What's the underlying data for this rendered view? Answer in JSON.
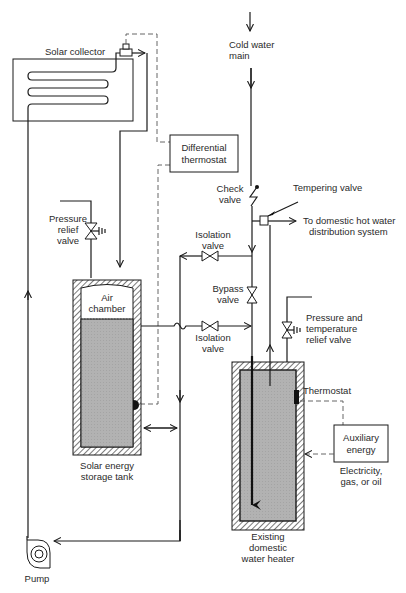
{
  "diagram": {
    "type": "solar domestic hot water system schematic",
    "colors": {
      "line": "#1a1a1a",
      "water_fill": "#b4b4b4",
      "insulation_hatch": "#333333",
      "background": "#ffffff"
    },
    "labels": {
      "solar_collector": "Solar collector",
      "cold_water_main_1": "Cold water",
      "cold_water_main_2": "main",
      "differential_thermostat_1": "Differential",
      "differential_thermostat_2": "thermostat",
      "check_valve_1": "Check",
      "check_valve_2": "valve",
      "tempering_valve": "Tempering valve",
      "to_domestic_1": "To domestic hot water",
      "to_domestic_2": "distribution system",
      "pressure_relief_1": "Pressure",
      "pressure_relief_2": "relief",
      "pressure_relief_3": "valve",
      "isolation_valve_upper_1": "Isolation",
      "isolation_valve_upper_2": "valve",
      "bypass_valve_1": "Bypass",
      "bypass_valve_2": "valve",
      "pt_relief_1": "Pressure and",
      "pt_relief_2": "temperature",
      "pt_relief_3": "relief valve",
      "air_chamber_1": "Air",
      "air_chamber_2": "chamber",
      "isolation_valve_lower_1": "Isolation",
      "isolation_valve_lower_2": "valve",
      "thermostat": "Thermostat",
      "auxiliary_energy_1": "Auxiliary",
      "auxiliary_energy_2": "energy",
      "aux_sources_1": "Electricity,",
      "aux_sources_2": "gas, or oil",
      "storage_tank_1": "Solar energy",
      "storage_tank_2": "storage tank",
      "water_heater_1": "Existing",
      "water_heater_2": "domestic",
      "water_heater_3": "water heater",
      "pump": "Pump"
    },
    "components": [
      {
        "id": "solar-collector",
        "icon": "serpentine-coil"
      },
      {
        "id": "differential-thermostat",
        "icon": "control-box"
      },
      {
        "id": "check-valve",
        "icon": "check-valve-symbol"
      },
      {
        "id": "tempering-valve",
        "icon": "square-valve"
      },
      {
        "id": "pressure-relief-valve",
        "icon": "relief-valve-symbol"
      },
      {
        "id": "isolation-valve-upper",
        "icon": "gate-valve-symbol"
      },
      {
        "id": "isolation-valve-lower",
        "icon": "gate-valve-symbol"
      },
      {
        "id": "bypass-valve",
        "icon": "gate-valve-symbol"
      },
      {
        "id": "pt-relief-valve",
        "icon": "relief-valve-symbol"
      },
      {
        "id": "solar-storage-tank",
        "icon": "insulated-tank"
      },
      {
        "id": "existing-water-heater",
        "icon": "insulated-tank"
      },
      {
        "id": "auxiliary-energy",
        "icon": "energy-box"
      },
      {
        "id": "pump",
        "icon": "centrifugal-pump"
      }
    ]
  }
}
